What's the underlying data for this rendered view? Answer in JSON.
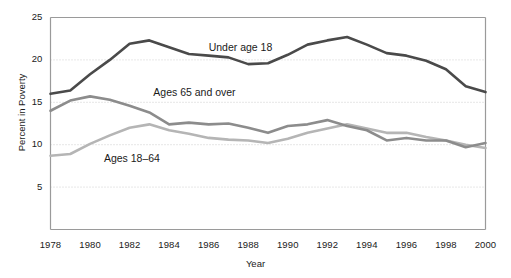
{
  "chart_data": {
    "type": "line",
    "title": "",
    "xlabel": "Year",
    "ylabel": "Percent in Poverty",
    "xlim": [
      1978,
      2000
    ],
    "ylim": [
      0,
      25
    ],
    "grid": true,
    "grid_axis": "y",
    "legend_position": "inline-annotations",
    "x": [
      1978,
      1979,
      1980,
      1981,
      1982,
      1983,
      1984,
      1985,
      1986,
      1987,
      1988,
      1989,
      1990,
      1991,
      1992,
      1993,
      1994,
      1995,
      1996,
      1997,
      1998,
      1999,
      2000
    ],
    "y_ticks": [
      5,
      10,
      15,
      20,
      25
    ],
    "y_tick_labels": [
      "5",
      "10",
      "15",
      "20",
      "25"
    ],
    "x_ticks": [
      1978,
      1980,
      1982,
      1984,
      1986,
      1988,
      1990,
      1992,
      1994,
      1996,
      1998,
      2000
    ],
    "x_tick_labels": [
      "1978",
      "1980",
      "1982",
      "1984",
      "1986",
      "1988",
      "1990",
      "1992",
      "1994",
      "1996",
      "1998",
      "2000"
    ],
    "series": [
      {
        "name": "Under age 18",
        "color": "#4a4a4a",
        "width": 2.6,
        "values": [
          16.0,
          16.4,
          18.3,
          20.0,
          21.9,
          22.3,
          21.5,
          20.7,
          20.5,
          20.3,
          19.5,
          19.6,
          20.6,
          21.8,
          22.3,
          22.7,
          21.8,
          20.8,
          20.5,
          19.9,
          18.9,
          16.9,
          16.2
        ],
        "label_text": "Under age 18"
      },
      {
        "name": "Ages 65 and over",
        "color": "#8c8c8c",
        "width": 2.6,
        "values": [
          14.0,
          15.2,
          15.7,
          15.3,
          14.6,
          13.8,
          12.4,
          12.6,
          12.4,
          12.5,
          12.0,
          11.4,
          12.2,
          12.4,
          12.9,
          12.2,
          11.7,
          10.5,
          10.8,
          10.5,
          10.5,
          9.7,
          10.2
        ],
        "label_text": "Ages 65 and over"
      },
      {
        "name": "Ages 18-64",
        "color": "#b5b5b5",
        "width": 2.6,
        "values": [
          8.7,
          8.9,
          10.1,
          11.1,
          12.0,
          12.4,
          11.7,
          11.3,
          10.8,
          10.6,
          10.5,
          10.2,
          10.7,
          11.4,
          11.9,
          12.4,
          11.9,
          11.4,
          11.4,
          10.9,
          10.5,
          10.0,
          9.6
        ],
        "label_text": "Ages 18–64"
      }
    ],
    "annotations": [
      {
        "text": "Under age 18",
        "x": 1986,
        "y": 21.4
      },
      {
        "text": "Ages 65 and over",
        "x": 1983.2,
        "y": 16.1
      },
      {
        "text": "Ages 18–64",
        "x": 1980.7,
        "y": 8.3
      }
    ]
  },
  "axes": {
    "y_title": "Percent in Poverty",
    "x_title": "Year"
  }
}
